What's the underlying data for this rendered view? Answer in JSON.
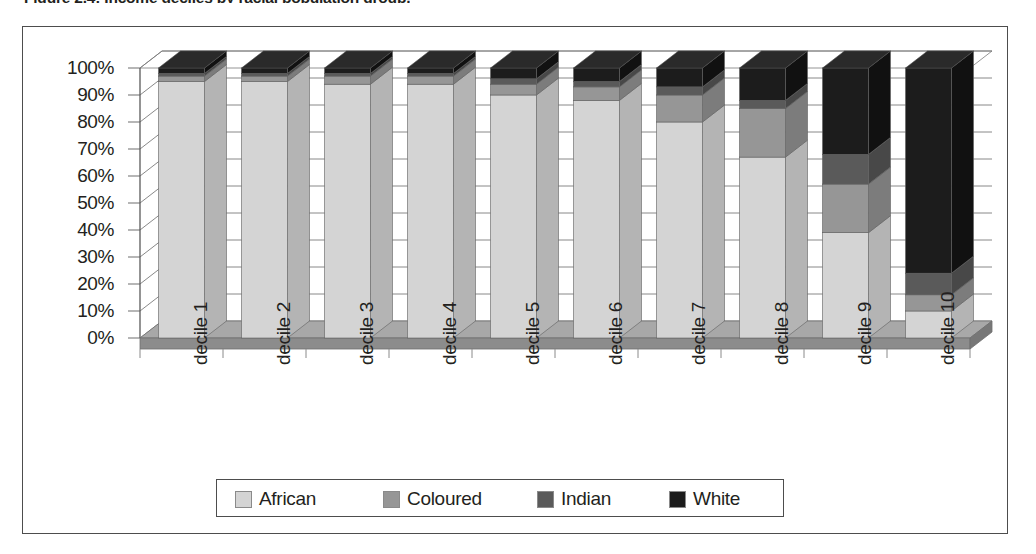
{
  "figure": {
    "caption": "Figure 2.4: Income deciles by racial population group,"
  },
  "legend": {
    "position": "bottom",
    "entries": [
      {
        "label": "African",
        "color": "#d4d4d4"
      },
      {
        "label": "Coloured",
        "color": "#969696"
      },
      {
        "label": "Indian",
        "color": "#5a5a5a"
      },
      {
        "label": "White",
        "color": "#1c1c1c"
      }
    ]
  },
  "axes": {
    "y_ticks": [
      "100%",
      "90%",
      "80%",
      "70%",
      "60%",
      "50%",
      "40%",
      "30%",
      "20%",
      "10%",
      "0%"
    ],
    "x_ticks": [
      "decile 1",
      "decile 2",
      "decile 3",
      "decile 4",
      "decile 5",
      "decile 6",
      "decile 7",
      "decile 8",
      "decile 9",
      "decile 10"
    ]
  },
  "colors": {
    "african": "#d4d4d4",
    "coloured": "#969696",
    "indian": "#5a5a5a",
    "white": "#1c1c1c",
    "african_side": "#b4b4b4",
    "coloured_side": "#7c7c7c",
    "indian_side": "#484848",
    "white_side": "#111111",
    "african_top": "#e4e4e4",
    "floor": "#8c8c8c",
    "floor_top": "#a8a8a8",
    "gridline": "#7a7a7a",
    "frame": "#4d4d4d",
    "text": "#231f20"
  },
  "chart_data": {
    "type": "bar",
    "subtype": "100% stacked column (3-D)",
    "title": "Income deciles by racial population group",
    "xlabel": "",
    "ylabel": "",
    "ylim": [
      0,
      100
    ],
    "yunit": "%",
    "grid": true,
    "legend_position": "bottom",
    "categories": [
      "decile 1",
      "decile 2",
      "decile 3",
      "decile 4",
      "decile 5",
      "decile 6",
      "decile 7",
      "decile 8",
      "decile 9",
      "decile 10"
    ],
    "series": [
      {
        "name": "African",
        "values": [
          95,
          95,
          94,
          94,
          90,
          88,
          80,
          67,
          39,
          10
        ]
      },
      {
        "name": "Coloured",
        "values": [
          2,
          2,
          3,
          3,
          4,
          5,
          10,
          18,
          18,
          6
        ]
      },
      {
        "name": "Indian",
        "values": [
          1,
          1,
          1,
          1,
          2,
          2,
          3,
          3,
          11,
          8
        ]
      },
      {
        "name": "White",
        "values": [
          2,
          2,
          2,
          2,
          4,
          5,
          7,
          12,
          32,
          76
        ]
      }
    ]
  }
}
